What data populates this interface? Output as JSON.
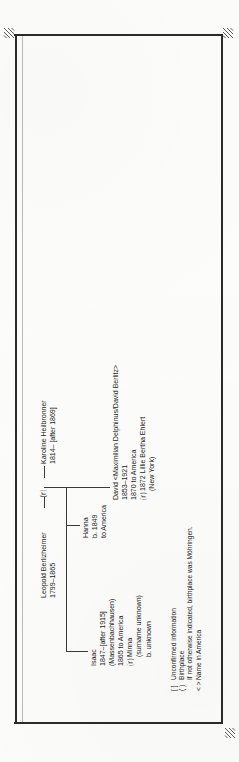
{
  "document": {
    "type": "genealogy-chart",
    "orientation": "rotated-90-clockwise",
    "ink_color": "#232323",
    "frame_color": "#2b2b2b"
  },
  "marks": {
    "registration_icon": "registration-corner-mark",
    "corners": [
      "top-left",
      "top-right",
      "bottom-right"
    ]
  },
  "tree": {
    "parents": {
      "father": {
        "name": "Leopold Berlizheimer",
        "dates": "1799–1865"
      },
      "marriage_symbol": "⒭",
      "mother": {
        "name": "Karoline Heilbronner",
        "dates": "1814– [after 1869]"
      }
    },
    "children": [
      {
        "id": "isaac",
        "lines": [
          "Isaac",
          "1847–[after 1915]",
          "(Massenbachhausen)",
          "1865 to America"
        ],
        "spouse": {
          "symbol": "⒭",
          "lines": [
            "Minna",
            "(surname unknown)",
            "b. unknown"
          ]
        }
      },
      {
        "id": "hanna",
        "lines": [
          "Hanna",
          "b. 1849",
          "to America"
        ],
        "spouse": null
      },
      {
        "id": "david",
        "lines": [
          "David <Maximilian Delphinus/David Berlitz>",
          "1853–1921",
          "1870 to America"
        ],
        "spouse": {
          "symbol": "⒭",
          "lines": [
            "1872 Lillie Bertha Ehlert",
            "(New York)"
          ]
        }
      }
    ]
  },
  "legend": {
    "rows": [
      {
        "symbol": "[ ]",
        "text": "Unconfirmed information"
      },
      {
        "symbol": "( )",
        "text": "Birthplace"
      },
      {
        "symbol": "",
        "text": "If not otherwise indicated, birthplace was Möhringen."
      },
      {
        "symbol": "< >",
        "text": "Name in America"
      }
    ]
  }
}
